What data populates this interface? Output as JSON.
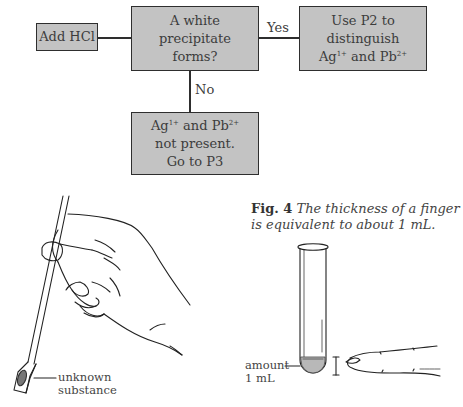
{
  "flowchart": {
    "start_box": {
      "text": "Add HCl"
    },
    "decision_box": {
      "lines": [
        "A white",
        "precipitate",
        "forms?"
      ]
    },
    "yes_label": "Yes",
    "no_label": "No",
    "yes_box": {
      "lines": [
        "Use P2 to",
        "distinguish"
      ],
      "ion_line": {
        "ion1": "Ag",
        "ion1_charge": "1+",
        "joiner": " and ",
        "ion2": "Pb",
        "ion2_charge": "2+"
      }
    },
    "no_box": {
      "ion_line": {
        "ion1": "Ag",
        "ion1_charge": "1+",
        "joiner": " and ",
        "ion2": "Pb",
        "ion2_charge": "2+"
      },
      "lines": [
        "not present.",
        "Go to P3"
      ]
    },
    "colors": {
      "box_fill": "#c3c3c3",
      "box_border": "#2e2e2e",
      "text": "#3c3c3c"
    }
  },
  "figure_caption": {
    "label": "Fig. 4",
    "text": "The thickness of a finger is equivalent to about 1 mL."
  },
  "illustrations": {
    "spatula": {
      "description": "hand holding spatula with sample",
      "label_line1": "unknown",
      "label_line2": "substance"
    },
    "test_tube": {
      "description": "test tube with small amount of liquid compared to finger thickness",
      "label_line1": "amount",
      "label_line2": "1 mL"
    }
  }
}
